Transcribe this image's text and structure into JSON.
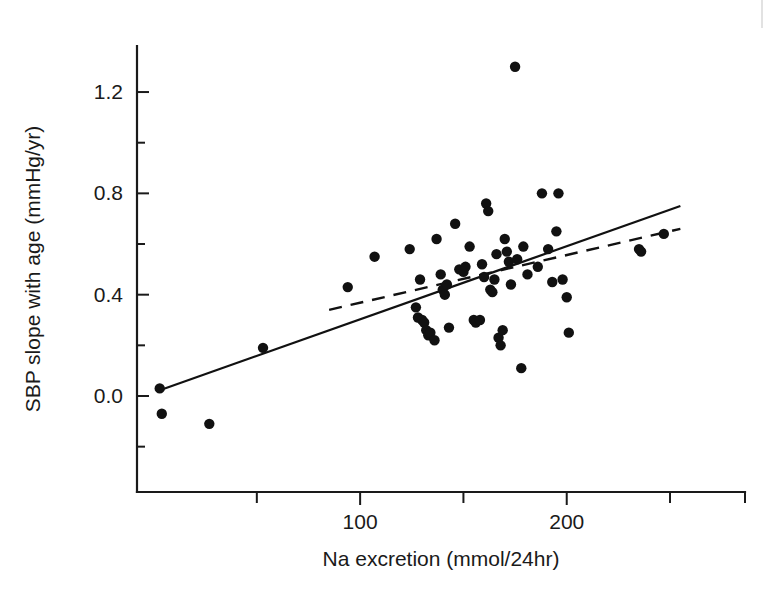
{
  "figure": {
    "background": "#ffffff",
    "ink_color": "#111111"
  },
  "chart_data": {
    "type": "scatter",
    "title": "",
    "xlabel": "Na excretion (mmol/24hr)",
    "ylabel": "SBP slope with age (mmHg/yr)",
    "xlim": [
      0,
      262
    ],
    "ylim": [
      -0.28,
      1.42
    ],
    "grid": false,
    "legend": "none",
    "x_ticks_major": [
      100,
      200
    ],
    "x_ticks_major_labels": [
      "100",
      "200"
    ],
    "x_ticks_minor": [
      50,
      150,
      250
    ],
    "y_ticks_major": [
      0.0,
      0.4,
      0.8,
      1.2
    ],
    "y_ticks_major_labels": [
      "0.0",
      "0.4",
      "0.8",
      "1.2"
    ],
    "y_ticks_minor": [
      -0.2,
      0.2,
      0.6,
      1.0,
      1.4
    ],
    "points": [
      [
        3,
        0.03
      ],
      [
        4,
        -0.07
      ],
      [
        27,
        -0.11
      ],
      [
        53,
        0.19
      ],
      [
        94,
        0.43
      ],
      [
        107,
        0.55
      ],
      [
        124,
        0.58
      ],
      [
        127,
        0.35
      ],
      [
        128,
        0.31
      ],
      [
        129,
        0.46
      ],
      [
        130,
        0.3
      ],
      [
        131,
        0.29
      ],
      [
        132,
        0.26
      ],
      [
        133,
        0.24
      ],
      [
        134,
        0.25
      ],
      [
        136,
        0.22
      ],
      [
        137,
        0.62
      ],
      [
        139,
        0.48
      ],
      [
        140,
        0.42
      ],
      [
        141,
        0.4
      ],
      [
        142,
        0.44
      ],
      [
        143,
        0.27
      ],
      [
        146,
        0.68
      ],
      [
        148,
        0.5
      ],
      [
        150,
        0.49
      ],
      [
        151,
        0.51
      ],
      [
        153,
        0.59
      ],
      [
        155,
        0.3
      ],
      [
        156,
        0.29
      ],
      [
        158,
        0.3
      ],
      [
        159,
        0.52
      ],
      [
        160,
        0.47
      ],
      [
        161,
        0.76
      ],
      [
        162,
        0.73
      ],
      [
        163,
        0.42
      ],
      [
        164,
        0.41
      ],
      [
        165,
        0.46
      ],
      [
        166,
        0.56
      ],
      [
        167,
        0.23
      ],
      [
        168,
        0.2
      ],
      [
        169,
        0.26
      ],
      [
        170,
        0.62
      ],
      [
        171,
        0.57
      ],
      [
        172,
        0.53
      ],
      [
        173,
        0.44
      ],
      [
        175,
        1.3
      ],
      [
        176,
        0.54
      ],
      [
        178,
        0.11
      ],
      [
        179,
        0.59
      ],
      [
        181,
        0.48
      ],
      [
        186,
        0.51
      ],
      [
        188,
        0.8
      ],
      [
        191,
        0.58
      ],
      [
        193,
        0.45
      ],
      [
        195,
        0.65
      ],
      [
        196,
        0.8
      ],
      [
        198,
        0.46
      ],
      [
        200,
        0.39
      ],
      [
        201,
        0.25
      ],
      [
        235,
        0.58
      ],
      [
        236,
        0.57
      ],
      [
        247,
        0.64
      ]
    ],
    "fit_lines": [
      {
        "name": "solid-regression-line",
        "style": "solid",
        "x_start": 2,
        "y_start": 0.02,
        "x_end": 255,
        "y_end": 0.75
      },
      {
        "name": "dashed-regression-line",
        "style": "dashed",
        "x_start": 85,
        "y_start": 0.34,
        "x_end": 255,
        "y_end": 0.66
      }
    ]
  }
}
